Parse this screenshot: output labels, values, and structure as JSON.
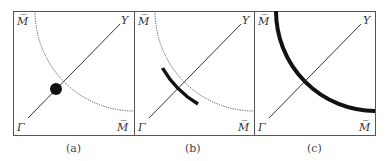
{
  "figure": {
    "panels": [
      {
        "id": "a",
        "caption": "(a)",
        "labels": {
          "top_left": "M̅",
          "top_right": "Y",
          "bottom_left": "Γ",
          "bottom_right": "M̅"
        },
        "curve_style": "dotted",
        "highlight": "dot at intersection"
      },
      {
        "id": "b",
        "caption": "(b)",
        "labels": {
          "top_left": "M̅",
          "top_right": "Y",
          "bottom_left": "Γ",
          "bottom_right": "M̅"
        },
        "curve_style": "dotted",
        "highlight": "thick segment around intersection"
      },
      {
        "id": "c",
        "caption": "(c)",
        "labels": {
          "top_left": "M̅",
          "top_right": "Y",
          "bottom_left": "Γ",
          "bottom_right": "M̅"
        },
        "curve_style": "thick solid",
        "highlight": "entire curve"
      }
    ],
    "colors": {
      "line": "#333333",
      "thick": "#111111",
      "frame": "#555555"
    }
  }
}
